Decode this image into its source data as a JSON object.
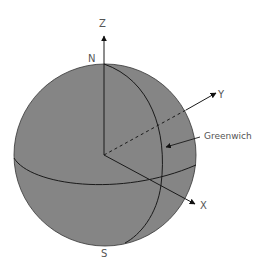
{
  "diagram": {
    "type": "earth-coordinate-system",
    "labels": {
      "z_axis": "Z",
      "y_axis": "Y",
      "x_axis": "X",
      "north": "N",
      "south": "S",
      "meridian": "Greenwich"
    },
    "colors": {
      "sphere_fill": "#858585",
      "line": "#1a1a1a",
      "label": "#555555",
      "background": "#ffffff"
    }
  }
}
